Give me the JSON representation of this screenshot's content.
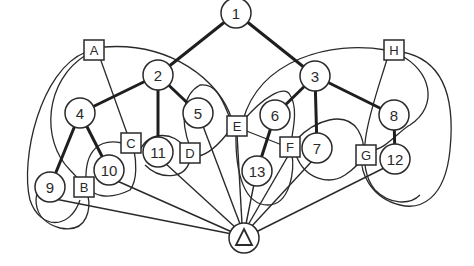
{
  "diagram": {
    "type": "graph",
    "circle_nodes": [
      {
        "id": "1",
        "label": "1",
        "x": 236,
        "y": 13
      },
      {
        "id": "2",
        "label": "2",
        "x": 158,
        "y": 75
      },
      {
        "id": "3",
        "label": "3",
        "x": 315,
        "y": 76
      },
      {
        "id": "4",
        "label": "4",
        "x": 80,
        "y": 113
      },
      {
        "id": "5",
        "label": "5",
        "x": 198,
        "y": 113
      },
      {
        "id": "6",
        "label": "6",
        "x": 275,
        "y": 115
      },
      {
        "id": "7",
        "label": "7",
        "x": 317,
        "y": 148
      },
      {
        "id": "8",
        "label": "8",
        "x": 394,
        "y": 115
      },
      {
        "id": "9",
        "label": "9",
        "x": 50,
        "y": 187
      },
      {
        "id": "10",
        "label": "10",
        "x": 109,
        "y": 170
      },
      {
        "id": "11",
        "label": "11",
        "x": 158,
        "y": 152
      },
      {
        "id": "12",
        "label": "12",
        "x": 395,
        "y": 159
      },
      {
        "id": "13",
        "label": "13",
        "x": 257,
        "y": 171
      }
    ],
    "box_nodes": [
      {
        "id": "A",
        "label": "A",
        "x": 94,
        "y": 50
      },
      {
        "id": "B",
        "label": "B",
        "x": 84,
        "y": 187
      },
      {
        "id": "C",
        "label": "C",
        "x": 131,
        "y": 143
      },
      {
        "id": "D",
        "label": "D",
        "x": 190,
        "y": 153
      },
      {
        "id": "E",
        "label": "E",
        "x": 237,
        "y": 126
      },
      {
        "id": "F",
        "label": "F",
        "x": 290,
        "y": 147
      },
      {
        "id": "G",
        "label": "G",
        "x": 366,
        "y": 155
      },
      {
        "id": "H",
        "label": "H",
        "x": 394,
        "y": 50
      }
    ],
    "root_node": {
      "id": "triangle",
      "label": "△",
      "x": 244,
      "y": 238
    },
    "tree_edges": [
      [
        "1",
        "2"
      ],
      [
        "1",
        "3"
      ],
      [
        "2",
        "4"
      ],
      [
        "2",
        "5"
      ],
      [
        "2",
        "11"
      ],
      [
        "3",
        "6"
      ],
      [
        "3",
        "7"
      ],
      [
        "3",
        "8"
      ],
      [
        "4",
        "9"
      ],
      [
        "4",
        "10"
      ],
      [
        "6",
        "13"
      ],
      [
        "8",
        "12"
      ]
    ],
    "root_edges": [
      "9",
      "10",
      "11",
      "5",
      "E",
      "13",
      "F",
      "7",
      "12"
    ]
  }
}
